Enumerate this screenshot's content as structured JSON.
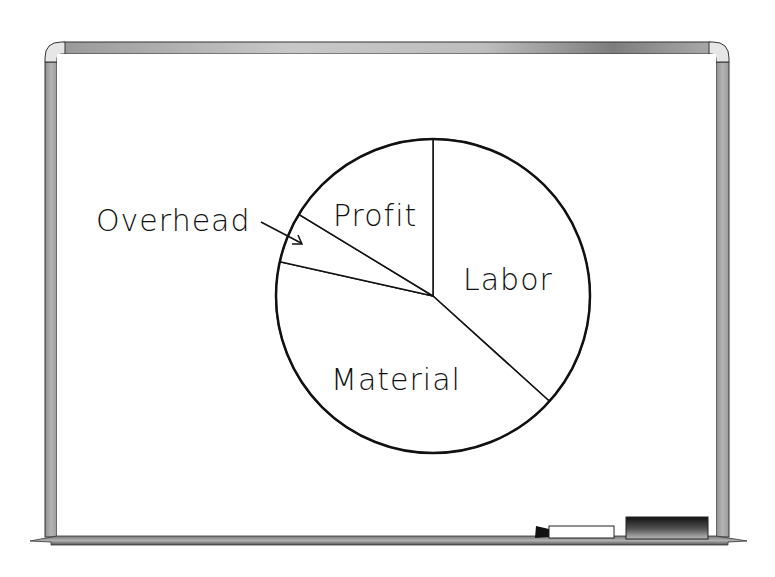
{
  "board": {
    "kind": "whiteboard",
    "accessories": [
      "marker",
      "eraser"
    ]
  },
  "chart_data": {
    "type": "pie",
    "title": "",
    "start": "12 o'clock",
    "direction": "clockwise",
    "slices": [
      {
        "label": "Labor",
        "percent": 36.7
      },
      {
        "label": "Material",
        "percent": 41.8
      },
      {
        "label": "Overhead",
        "percent": 5.2
      },
      {
        "label": "Profit",
        "percent": 16.3
      }
    ],
    "annotations": [
      {
        "text": "Overhead",
        "type": "arrow-callout",
        "target": "Overhead",
        "side": "left"
      }
    ],
    "colors": {
      "fill": "#ffffff",
      "stroke": "#111111"
    }
  }
}
